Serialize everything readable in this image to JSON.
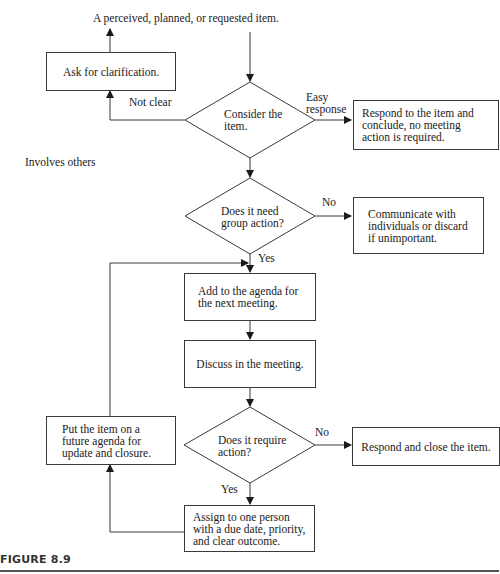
{
  "diagram": {
    "start_label": "A perceived, planned, or requested item.",
    "nodes": {
      "ask_clarification": "Ask for clarification.",
      "consider": "Consider the item.",
      "consider_lines": [
        "Consider the",
        "item."
      ],
      "respond_conclude": "Respond to the item and conclude, no meeting action is required.",
      "group_action": "Does it need group action?",
      "group_action_lines": [
        "Does it need",
        "group action?"
      ],
      "communicate": "Communicate with individuals or discard if unimportant.",
      "add_agenda": "Add to the agenda for the next meeting.",
      "discuss": "Discuss in the meeting.",
      "require_action": "Does it require action?",
      "require_action_lines": [
        "Does it require",
        "action?"
      ],
      "respond_close": "Respond and close the item.",
      "future_agenda": "Put the item on a future agenda for update and closure.",
      "assign": "Assign to one person with a due date, priority, and clear outcome."
    },
    "edge_labels": {
      "not_clear": "Not clear",
      "easy_response_1": "Easy",
      "easy_response_2": "response",
      "involves_others": "Involves others",
      "no_1": "No",
      "yes_1": "Yes",
      "no_2": "No",
      "yes_2": "Yes"
    },
    "caption": "FIGURE 8.9",
    "colors": {
      "line": "#3a3a3a",
      "text": "#1a1a1a",
      "rule": "#555555"
    }
  }
}
